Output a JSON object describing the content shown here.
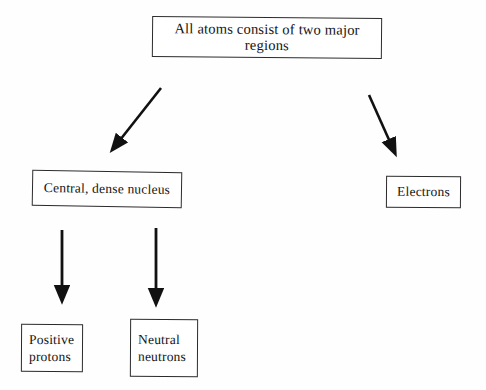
{
  "diagram": {
    "title_text": "All atoms consist of two major regions",
    "nodes": {
      "root": {
        "label": "All atoms consist of two major regions"
      },
      "nucleus": {
        "label": "Central, dense nucleus"
      },
      "electrons": {
        "label": "Electrons"
      },
      "protons": {
        "label": "Positive\nprotons"
      },
      "neutrons": {
        "label": "Neutral\nneutrons"
      }
    },
    "edges": [
      {
        "name": "root-to-nucleus",
        "from": "root",
        "to": "nucleus",
        "style": "solid-arrow",
        "direction": "down-left"
      },
      {
        "name": "root-to-electrons",
        "from": "root",
        "to": "electrons",
        "style": "solid-arrow",
        "direction": "down-right"
      },
      {
        "name": "nucleus-to-protons",
        "from": "nucleus",
        "to": "protons",
        "style": "solid-arrow",
        "direction": "down"
      },
      {
        "name": "nucleus-to-neutrons",
        "from": "nucleus",
        "to": "neutrons",
        "style": "solid-arrow",
        "direction": "down"
      }
    ],
    "colors": {
      "background": "#fefefe",
      "box_border": "#2b2b2b",
      "text": "#141414",
      "arrow": "#111111"
    }
  }
}
